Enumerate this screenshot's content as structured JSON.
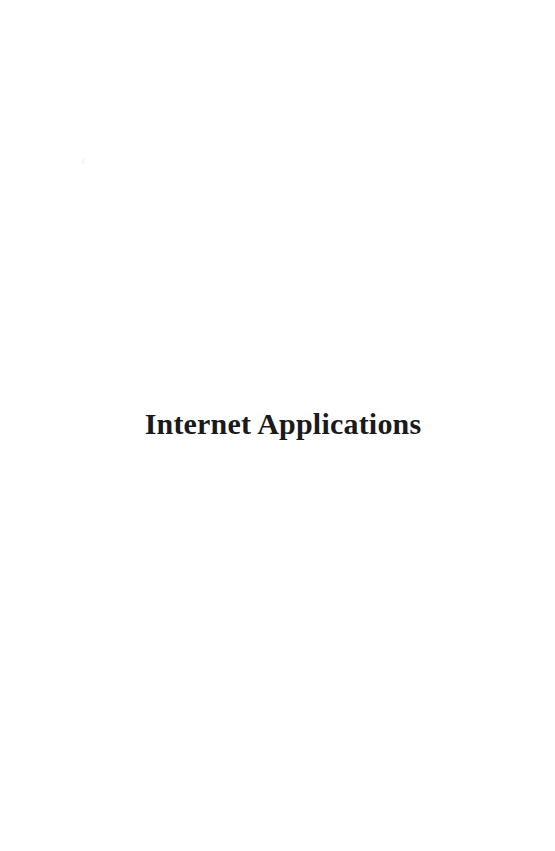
{
  "document": {
    "type": "scanned-book-page",
    "page_kind": "part-title-page",
    "background_color": "#ffffff",
    "text_color": "#1a1a1c"
  },
  "title_block": {
    "title": "Internet Applications"
  },
  "artifacts": {
    "speck_label": ""
  }
}
